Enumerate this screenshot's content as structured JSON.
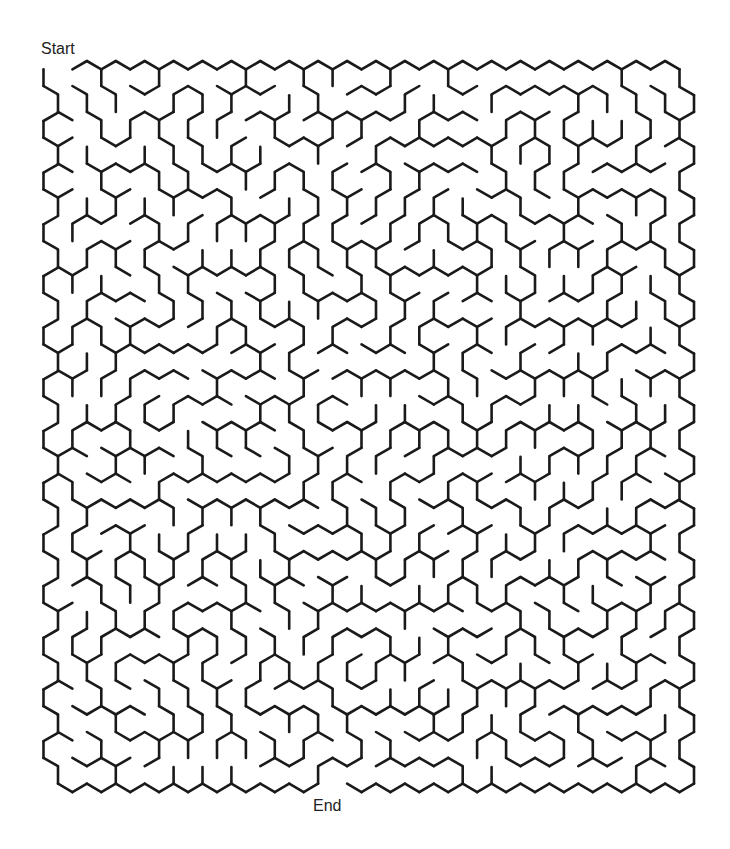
{
  "puzzle": {
    "type": "hexagonal maze",
    "start_label": "Start",
    "end_label": "End",
    "grid": {
      "cell_shape": "hexagon (pointy-top)",
      "rows": 28,
      "columns": 22
    },
    "entrance": {
      "row": 0,
      "column": 0,
      "side": "top"
    },
    "exit": {
      "row": 27,
      "column": 9,
      "side": "bottom"
    },
    "wall_color": "#1a1a1a",
    "background_color": "#ffffff"
  }
}
